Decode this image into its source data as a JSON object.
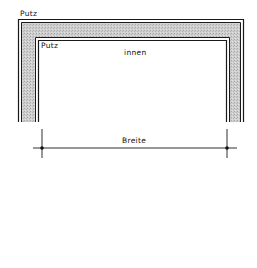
{
  "drawing": {
    "type": "wall-opening-section",
    "labels": {
      "outer_plaster": "Putz",
      "inner_plaster": "Putz",
      "interior": "innen",
      "dimension": "Breite"
    },
    "colors": {
      "line": "#1a1a1a",
      "hatch_fill": "#c8c8c8",
      "background": "#ffffff"
    }
  }
}
